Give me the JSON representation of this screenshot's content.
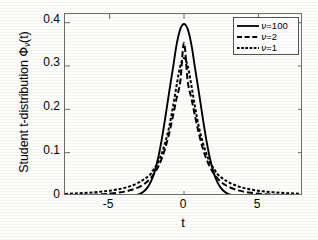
{
  "chart_data": {
    "type": "line",
    "title": "",
    "xlabel": "t",
    "ylabel": "Student t-distribution Φν(t)",
    "ylabel_parts": {
      "prefix": "Student t-distribution ",
      "symbol": "Φ",
      "subscript": "ν",
      "suffix": "(t)"
    },
    "xlim": [
      -8,
      8
    ],
    "ylim": [
      0,
      0.42
    ],
    "xticks": [
      -5,
      0,
      5
    ],
    "xticklabels": [
      "-5",
      "0",
      "5"
    ],
    "yticks": [
      0,
      0.1,
      0.2,
      0.3,
      0.4
    ],
    "yticklabels": [
      "0",
      "0.1",
      "0.2",
      "0.3",
      "0.4"
    ],
    "grid": false,
    "legend_position": "upper right",
    "series": [
      {
        "name": "ν=100",
        "nu": 100,
        "linestyle": "solid",
        "color": "#000000",
        "peak": 0.397,
        "x": [
          -8,
          -7.5,
          -7,
          -6.5,
          -6,
          -5.5,
          -5,
          -4.5,
          -4,
          -3.5,
          -3,
          -2.75,
          -2.5,
          -2.25,
          -2,
          -1.75,
          -1.5,
          -1.25,
          -1,
          -0.75,
          -0.5,
          -0.25,
          0,
          0.25,
          0.5,
          0.75,
          1,
          1.25,
          1.5,
          1.75,
          2,
          2.25,
          2.5,
          2.75,
          3,
          3.5,
          4,
          4.5,
          5,
          5.5,
          6,
          6.5,
          7,
          7.5,
          8
        ],
        "y": [
          0.0,
          0.0,
          0.0,
          0.0,
          0.0,
          0.0,
          0.0,
          0.0,
          0.0002,
          0.0009,
          0.0045,
          0.0092,
          0.0176,
          0.0313,
          0.0534,
          0.086,
          0.1297,
          0.1824,
          0.2393,
          0.2933,
          0.3487,
          0.3851,
          0.397,
          0.3851,
          0.3487,
          0.2933,
          0.2393,
          0.1824,
          0.1297,
          0.086,
          0.0534,
          0.0313,
          0.0176,
          0.0092,
          0.0045,
          0.0009,
          0.0002,
          0.0,
          0.0,
          0.0,
          0.0,
          0.0,
          0.0,
          0.0,
          0.0
        ]
      },
      {
        "name": "ν=2",
        "nu": 2,
        "linestyle": "dashed",
        "color": "#000000",
        "peak": 0.3536,
        "x": [
          -8,
          -7.5,
          -7,
          -6.5,
          -6,
          -5.5,
          -5,
          -4.5,
          -4,
          -3.5,
          -3,
          -2.75,
          -2.5,
          -2.25,
          -2,
          -1.75,
          -1.5,
          -1.25,
          -1,
          -0.75,
          -0.5,
          -0.25,
          0,
          0.25,
          0.5,
          0.75,
          1,
          1.25,
          1.5,
          1.75,
          2,
          2.25,
          2.5,
          2.75,
          3,
          3.5,
          4,
          4.5,
          5,
          5.5,
          6,
          6.5,
          7,
          7.5,
          8
        ],
        "y": [
          0.0013,
          0.0016,
          0.0019,
          0.0024,
          0.0031,
          0.004,
          0.0054,
          0.0073,
          0.0101,
          0.0144,
          0.0211,
          0.026,
          0.0324,
          0.0408,
          0.0518,
          0.0665,
          0.086,
          0.1117,
          0.1443,
          0.1832,
          0.2253,
          0.2642,
          0.3536,
          0.2642,
          0.2253,
          0.1832,
          0.1443,
          0.1117,
          0.086,
          0.0665,
          0.0518,
          0.0408,
          0.0324,
          0.026,
          0.0211,
          0.0144,
          0.0101,
          0.0073,
          0.0054,
          0.004,
          0.0031,
          0.0024,
          0.0019,
          0.0016,
          0.0013
        ]
      },
      {
        "name": "ν=1",
        "nu": 1,
        "linestyle": "dashdot",
        "color": "#000000",
        "peak": 0.3183,
        "x": [
          -8,
          -7.5,
          -7,
          -6.5,
          -6,
          -5.5,
          -5,
          -4.5,
          -4,
          -3.5,
          -3,
          -2.75,
          -2.5,
          -2.25,
          -2,
          -1.75,
          -1.5,
          -1.25,
          -1,
          -0.75,
          -0.5,
          -0.25,
          0,
          0.25,
          0.5,
          0.75,
          1,
          1.25,
          1.5,
          1.75,
          2,
          2.25,
          2.5,
          2.75,
          3,
          3.5,
          4,
          4.5,
          5,
          5.5,
          6,
          6.5,
          7,
          7.5,
          8
        ],
        "y": [
          0.0049,
          0.0056,
          0.0064,
          0.0074,
          0.0086,
          0.0102,
          0.0122,
          0.0149,
          0.0187,
          0.0241,
          0.0318,
          0.0369,
          0.043,
          0.0504,
          0.0637,
          0.0769,
          0.0979,
          0.1249,
          0.1592,
          0.2037,
          0.2546,
          0.2996,
          0.3183,
          0.2996,
          0.2546,
          0.2037,
          0.1592,
          0.1249,
          0.0979,
          0.0769,
          0.0637,
          0.0504,
          0.043,
          0.0369,
          0.0318,
          0.0241,
          0.0187,
          0.0149,
          0.0122,
          0.0102,
          0.0086,
          0.0074,
          0.0064,
          0.0056,
          0.0049
        ]
      }
    ]
  },
  "legend": {
    "items": [
      {
        "label": "ν=100",
        "style": "solid"
      },
      {
        "label": "ν=2",
        "style": "dashed"
      },
      {
        "label": "ν=1",
        "style": "dashdot"
      }
    ]
  },
  "axes": {
    "x_title": "t",
    "y_title_prefix": "Student t-distribution ",
    "y_title_symbol": "Φ",
    "y_title_sub": "ν",
    "y_title_suffix": "(t)"
  }
}
